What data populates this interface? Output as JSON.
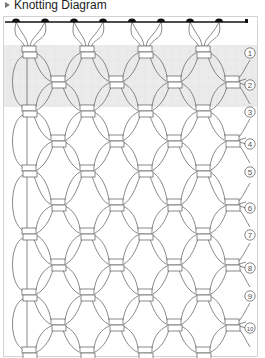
{
  "header": {
    "title": "Knotting Diagram",
    "icon": "bullet-triangle-icon"
  },
  "diagram": {
    "type": "macrame-square-knot-pattern",
    "colors": {
      "line": "#6b6b6b",
      "dowel": "#111111",
      "highlight_band": "#ebebeb",
      "frame": "#d4d4d4",
      "label": "#555555"
    },
    "dowel": {
      "y": 22,
      "x_start": 5,
      "x_end": 247,
      "mounts_x": [
        16,
        45,
        74,
        103,
        132,
        161,
        190,
        219
      ]
    },
    "highlight_band": {
      "y_start": 45,
      "y_end": 107,
      "rows": [
        1,
        2
      ]
    },
    "odd_row_knot_x": [
      29,
      87,
      145,
      203
    ],
    "even_row_knot_x": [
      58,
      116,
      174,
      232
    ],
    "rows": [
      {
        "label": "①",
        "number": 1,
        "y": 52
      },
      {
        "label": "②",
        "number": 2,
        "y": 82
      },
      {
        "label": "③",
        "number": 3,
        "y": 111
      },
      {
        "label": "④",
        "number": 4,
        "y": 141
      },
      {
        "label": "⑤",
        "number": 5,
        "y": 171
      },
      {
        "label": "⑥",
        "number": 6,
        "y": 205
      },
      {
        "label": "⑦",
        "number": 7,
        "y": 234
      },
      {
        "label": "⑧",
        "number": 8,
        "y": 265
      },
      {
        "label": "⑨",
        "number": 9,
        "y": 295
      },
      {
        "label": "⑩",
        "number": 10,
        "y": 325
      }
    ],
    "bottom_partial_row_y": 353
  }
}
